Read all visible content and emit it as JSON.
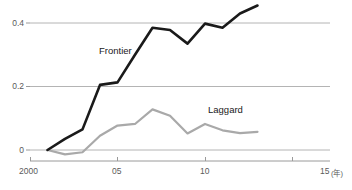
{
  "chart_data": {
    "type": "line",
    "title": "",
    "subtitle": "",
    "xlabel": "",
    "ylabel": "",
    "xunit": "(年)",
    "grid": true,
    "gridlines_y": [
      0,
      0.2,
      0.4
    ],
    "legend_position": "inline-annotation",
    "xlim": [
      2000,
      2015
    ],
    "ylim": [
      -0.03,
      0.47
    ],
    "xticks": [
      2000,
      2005,
      2010,
      2015
    ],
    "xticklabels": [
      "2000",
      "05",
      "10",
      "15"
    ],
    "yticks": [
      0,
      0.2,
      0.4
    ],
    "yticklabels": [
      "0",
      "0.2",
      "0.4"
    ],
    "x": [
      2001,
      2002,
      2003,
      2004,
      2005,
      2006,
      2007,
      2008,
      2009,
      2010,
      2011,
      2012,
      2013
    ],
    "series": [
      {
        "name": "Frontier",
        "color": "#1a1a1a",
        "width": 2.6,
        "values": [
          0.0,
          0.035,
          0.065,
          0.205,
          0.213,
          0.3,
          0.385,
          0.378,
          0.335,
          0.398,
          0.385,
          0.43,
          0.455
        ]
      },
      {
        "name": "Laggard",
        "color": "#a9a9a9",
        "width": 2.2,
        "values": [
          0.0,
          -0.014,
          -0.007,
          0.045,
          0.077,
          0.082,
          0.128,
          0.108,
          0.052,
          0.082,
          0.062,
          0.053,
          0.057
        ]
      }
    ],
    "annotations": [
      {
        "text": "Frontier",
        "x": 2004.1,
        "y": 0.285
      },
      {
        "text": "Laggard",
        "x": 2010.0,
        "y": 0.152
      }
    ]
  },
  "axis": {
    "ytick_0": "0",
    "ytick_02": "0.2",
    "ytick_04": "0.4",
    "xtick_2000": "2000",
    "xtick_05": "05",
    "xtick_10": "10",
    "xtick_15": "15",
    "xunit": "(年)"
  },
  "labels": {
    "frontier": "Frontier",
    "laggard": "Laggard"
  },
  "colors": {
    "frontier_line": "#1a1a1a",
    "laggard_line": "#a9a9a9",
    "gridline": "#b4b4b4",
    "axis": "#9a9a9a",
    "text": "#5a5a5a",
    "background": "#ffffff"
  }
}
